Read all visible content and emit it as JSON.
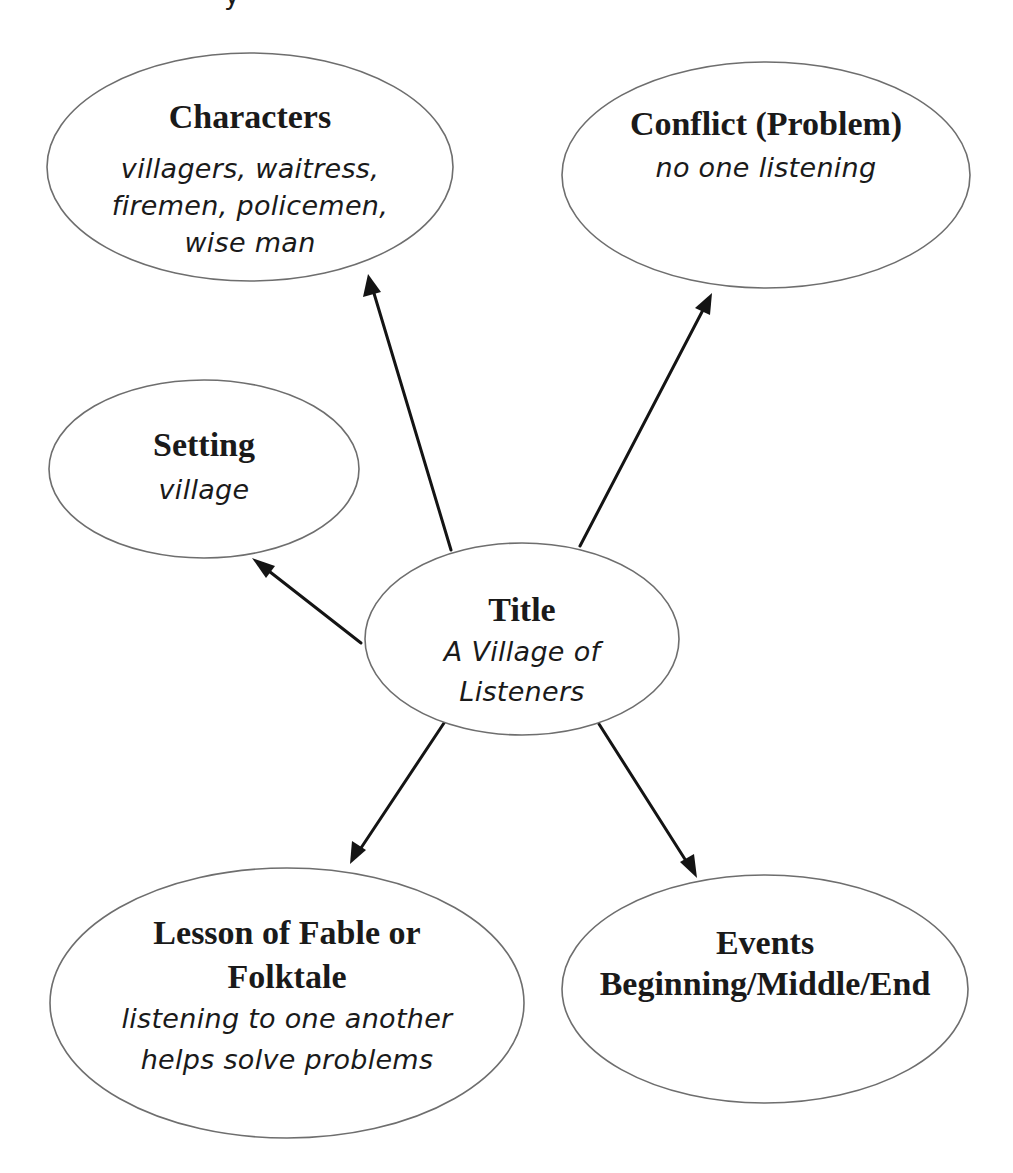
{
  "diagram": {
    "type": "story-map",
    "colors": {
      "background": "#ffffff",
      "ellipse_stroke": "#6e6e6e",
      "arrow": "#141414",
      "text": "#1a1a1a"
    },
    "top_fragment": "y",
    "nodes": {
      "characters": {
        "heading": "Characters",
        "lines": [
          "villagers, waitress,",
          "firemen, policemen,",
          "wise man"
        ]
      },
      "conflict": {
        "heading": "Conflict (Problem)",
        "lines": [
          "no one listening"
        ]
      },
      "setting": {
        "heading": "Setting",
        "lines": [
          "village"
        ]
      },
      "title": {
        "heading": "Title",
        "lines": [
          "A Village of",
          "Listeners"
        ]
      },
      "lesson": {
        "heading_lines": [
          "Lesson of Fable or",
          "Folktale"
        ],
        "lines": [
          "listening to one another",
          "helps solve problems"
        ]
      },
      "events": {
        "heading_lines": [
          "Events",
          "Beginning/Middle/End"
        ],
        "lines": []
      }
    },
    "edges": [
      {
        "from": "title",
        "to": "characters"
      },
      {
        "from": "title",
        "to": "conflict"
      },
      {
        "from": "title",
        "to": "setting"
      },
      {
        "from": "title",
        "to": "lesson"
      },
      {
        "from": "title",
        "to": "events"
      }
    ]
  }
}
